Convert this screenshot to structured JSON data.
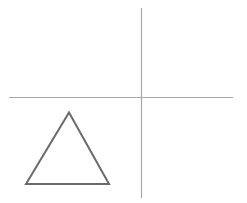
{
  "diagram": {
    "background": "#ffffff",
    "axes": {
      "color": "#a8a8a8",
      "stroke_width": 1.2,
      "horizontal": {
        "x1": 9,
        "y1": 97.5,
        "x2": 233,
        "y2": 97.5
      },
      "vertical": {
        "x1": 141.5,
        "y1": 8,
        "x2": 141.5,
        "y2": 198
      }
    },
    "triangle": {
      "color": "#6a6a6a",
      "stroke_width": 2,
      "points": "69,112.5 26,184 109,184"
    }
  }
}
